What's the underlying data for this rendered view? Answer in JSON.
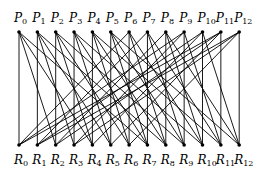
{
  "diagram": {
    "type": "bipartite-graph",
    "top_nodes": [
      "P0",
      "P1",
      "P2",
      "P3",
      "P4",
      "P5",
      "P6",
      "P7",
      "P8",
      "P9",
      "P10",
      "P11",
      "P12"
    ],
    "bottom_nodes": [
      "R0",
      "R1",
      "R2",
      "R3",
      "R4",
      "R5",
      "R6",
      "R7",
      "R8",
      "R9",
      "R10",
      "R11",
      "R12"
    ],
    "top_prefix": "P",
    "bottom_prefix": "R",
    "node_count": 13,
    "edge_offsets_mod_n": [
      0,
      2,
      4,
      7
    ],
    "colors": {
      "edge": "#000000",
      "node": "#000000",
      "background": "#ffffff"
    }
  }
}
